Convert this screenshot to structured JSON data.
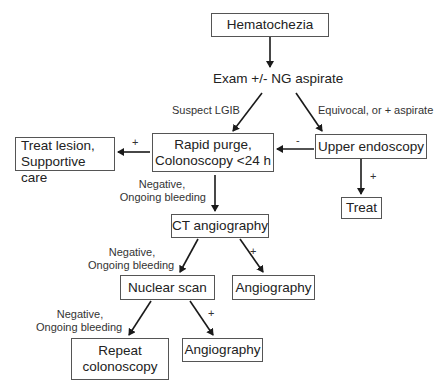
{
  "diagram": {
    "type": "flowchart",
    "nodes": {
      "hematochezia": "Hematochezia",
      "exam": "Exam +/- NG aspirate",
      "rapid_purge_line1": "Rapid purge,",
      "rapid_purge_line2": "Colonoscopy <24 h",
      "treat_lesion_line1": "Treat lesion,",
      "treat_lesion_line2": "Supportive care",
      "upper_endoscopy": "Upper endoscopy",
      "treat": "Treat",
      "ct_angiography": "CT angiography",
      "angiography_1": "Angiography",
      "nuclear_scan": "Nuclear scan",
      "angiography_2": "Angiography",
      "repeat_colonoscopy_line1": "Repeat",
      "repeat_colonoscopy_line2": "colonoscopy"
    },
    "edge_labels": {
      "suspect_lgib": "Suspect LGIB",
      "equivocal": "Equivocal, or + aspirate",
      "plus_treat_lesion": "+",
      "minus_upper": "-",
      "plus_treat": "+",
      "neg_ongoing_1_line1": "Negative,",
      "neg_ongoing_1_line2": "Ongoing bleeding",
      "neg_ongoing_2_line1": "Negative,",
      "neg_ongoing_2_line2": "Ongoing bleeding",
      "plus_angio_1": "+",
      "neg_ongoing_3_line1": "Negative,",
      "neg_ongoing_3_line2": "Ongoing bleeding",
      "plus_angio_2": "+"
    },
    "edges": [
      {
        "from": "Hematochezia",
        "to": "Exam +/- NG aspirate",
        "label": ""
      },
      {
        "from": "Exam +/- NG aspirate",
        "to": "Rapid purge, Colonoscopy <24 h",
        "label": "Suspect LGIB"
      },
      {
        "from": "Exam +/- NG aspirate",
        "to": "Upper endoscopy",
        "label": "Equivocal, or + aspirate"
      },
      {
        "from": "Upper endoscopy",
        "to": "Rapid purge, Colonoscopy <24 h",
        "label": "-"
      },
      {
        "from": "Upper endoscopy",
        "to": "Treat",
        "label": "+"
      },
      {
        "from": "Rapid purge, Colonoscopy <24 h",
        "to": "Treat lesion, Supportive care",
        "label": "+"
      },
      {
        "from": "Rapid purge, Colonoscopy <24 h",
        "to": "CT angiography",
        "label": "Negative, Ongoing bleeding"
      },
      {
        "from": "CT angiography",
        "to": "Nuclear scan",
        "label": "Negative, Ongoing bleeding"
      },
      {
        "from": "CT angiography",
        "to": "Angiography",
        "label": "+"
      },
      {
        "from": "Nuclear scan",
        "to": "Repeat colonoscopy",
        "label": "Negative, Ongoing bleeding"
      },
      {
        "from": "Nuclear scan",
        "to": "Angiography",
        "label": "+"
      }
    ],
    "colors": {
      "line": "#1a1a1a",
      "box_border": "#555555",
      "background": "#ffffff"
    }
  }
}
